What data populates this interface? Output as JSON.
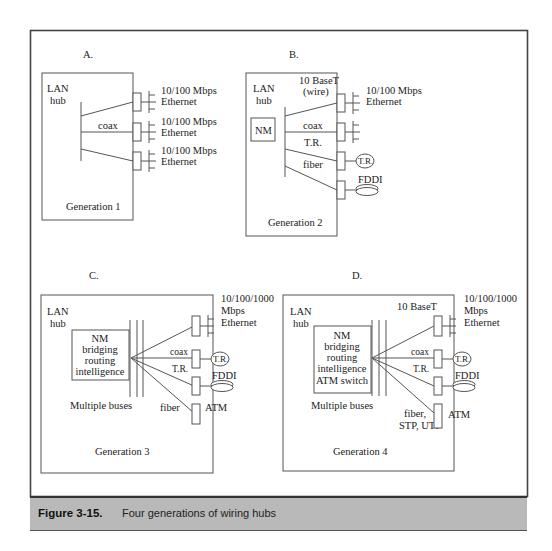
{
  "figure": {
    "number": "Figure 3-15.",
    "caption": "Four generations of wiring hubs"
  },
  "panels": {
    "a": {
      "letter": "A.",
      "hub_label_1": "LAN",
      "hub_label_2": "hub",
      "bus_label": "coax",
      "generation": "Generation 1",
      "ports": [
        {
          "line1": "10/100 Mbps",
          "line2": "Ethernet"
        },
        {
          "line1": "10/100 Mbps",
          "line2": "Ethernet"
        },
        {
          "line1": "10/100 Mbps",
          "line2": "Ethernet"
        }
      ]
    },
    "b": {
      "letter": "B.",
      "hub_label_1": "LAN",
      "hub_label_2": "hub",
      "nm": "NM",
      "media_1": "10 BaseT",
      "media_1b": "(wire)",
      "media_2": "coax",
      "media_3": "T.R.",
      "media_4": "fiber",
      "ethernet_1": "10/100 Mbps",
      "ethernet_2": "Ethernet",
      "tr_ring": "T.R.",
      "fddi": "FDDI",
      "generation": "Generation 2"
    },
    "c": {
      "letter": "C.",
      "hub_label_1": "LAN",
      "hub_label_2": "hub",
      "module": [
        "NM",
        "bridging",
        "routing",
        "intelligence"
      ],
      "buses": "Multiple buses",
      "media_coax": "coax",
      "media_tr": "T.R.",
      "media_fiber": "fiber",
      "ethernet_1": "10/100/1000",
      "ethernet_2": "Mbps",
      "ethernet_3": "Ethernet",
      "tr_ring": "T.R.",
      "fddi": "FDDI",
      "atm": "ATM",
      "generation": "Generation 3"
    },
    "d": {
      "letter": "D.",
      "hub_label_1": "LAN",
      "hub_label_2": "hub",
      "module": [
        "NM",
        "bridging",
        "routing",
        "intelligence",
        "ATM switch"
      ],
      "buses": "Multiple buses",
      "media_top": "10 BaseT",
      "media_coax": "coax",
      "media_tr": "T.R.",
      "media_fiber_1": "fiber,",
      "media_fiber_2": "STP, UTP",
      "ethernet_1": "10/100/1000",
      "ethernet_2": "Mbps",
      "ethernet_3": "Ethernet",
      "tr_ring": "T.R.",
      "fddi": "FDDI",
      "atm": "ATM",
      "generation": "Generation 4"
    }
  }
}
